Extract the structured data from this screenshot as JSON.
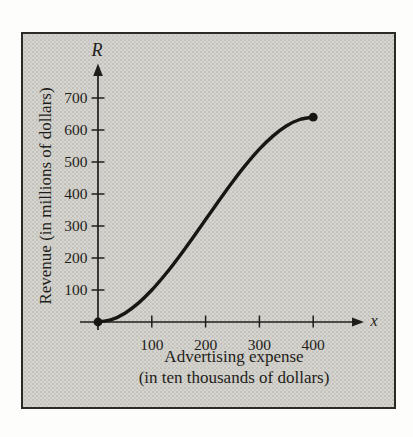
{
  "figure": {
    "page_bg": "#fdfdfb",
    "panel_bg": "#d5d4cf",
    "frame_color": "#2b2a26",
    "ink": "#1f1e1a"
  },
  "chart_data": {
    "type": "line",
    "title": "",
    "x_axis_symbol": "x",
    "y_axis_symbol": "R",
    "xlabel": [
      "Advertising expense",
      "(in ten thousands of dollars)"
    ],
    "ylabel": "Revenue (in millions of dollars)",
    "x_ticks": [
      100,
      200,
      300,
      400
    ],
    "y_ticks": [
      100,
      200,
      300,
      400,
      500,
      600,
      700
    ],
    "xlim": [
      0,
      500
    ],
    "ylim": [
      0,
      780
    ],
    "grid": false,
    "legend": "none",
    "series": [
      {
        "name": "revenue-curve",
        "x": [
          0,
          25,
          50,
          75,
          100,
          125,
          150,
          175,
          200,
          225,
          250,
          275,
          300,
          325,
          350,
          375,
          400
        ],
        "y": [
          0,
          7.2,
          27.5,
          59.1,
          100,
          148.4,
          202.5,
          260.3,
          320,
          379.7,
          437.5,
          491.6,
          540,
          580.9,
          612.5,
          632.8,
          640
        ],
        "start_point": [
          0,
          0
        ],
        "end_point": [
          400,
          640
        ]
      }
    ]
  }
}
